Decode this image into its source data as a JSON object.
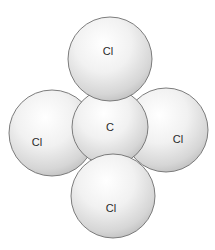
{
  "diagram": {
    "title": "",
    "molecule": "CCl4 space-filling model",
    "background_color": "#ffffff",
    "sphere_colors": {
      "highlight": "#ffffff",
      "mid": "#e9e9e9",
      "shadow": "#b9b9b9",
      "outline": "#6e6e6e"
    },
    "atoms": [
      {
        "id": "cl-left",
        "label": "Cl",
        "cx": 52,
        "cy": 133,
        "r": 43,
        "label_x": 37,
        "label_y": 142
      },
      {
        "id": "cl-right",
        "label": "Cl",
        "cx": 166,
        "cy": 130,
        "r": 42,
        "label_x": 178,
        "label_y": 139
      },
      {
        "id": "c-center",
        "label": "C",
        "cx": 110,
        "cy": 127,
        "r": 38,
        "label_x": 110,
        "label_y": 127
      },
      {
        "id": "cl-top",
        "label": "Cl",
        "cx": 110,
        "cy": 59,
        "r": 42,
        "label_x": 108,
        "label_y": 51
      },
      {
        "id": "cl-bottom",
        "label": "Cl",
        "cx": 113,
        "cy": 196,
        "r": 42,
        "label_x": 111,
        "label_y": 208
      }
    ]
  }
}
